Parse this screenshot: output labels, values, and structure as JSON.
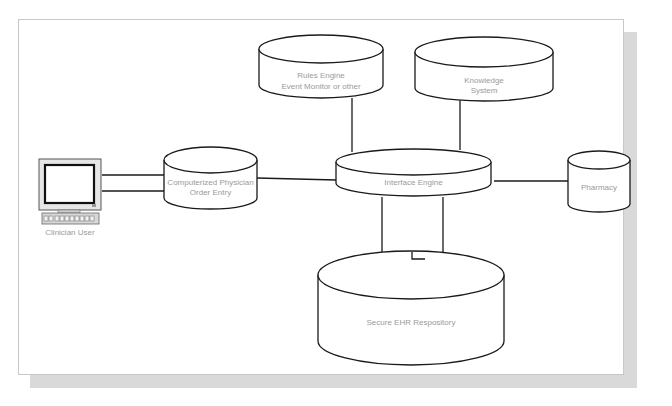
{
  "diagram": {
    "nodes": {
      "rules_engine": {
        "line1": "Rules Engine",
        "line2": "Event Monitor or other"
      },
      "knowledge_system": {
        "line1": "Knowledge",
        "line2": "System"
      },
      "cpoe": {
        "line1": "Computerized Physician",
        "line2": "Order Entry"
      },
      "interface_engine": {
        "label": "Interface Engine"
      },
      "pharmacy": {
        "label": "Pharmacy"
      },
      "ehr_repository": {
        "label": "Secure EHR Respository"
      },
      "clinician": {
        "label": "Clinician User",
        "icon": "computer-workstation-icon"
      }
    },
    "edges": [
      {
        "from": "clinician",
        "to": "cpoe",
        "style": "double-line"
      },
      {
        "from": "cpoe",
        "to": "interface_engine",
        "style": "line"
      },
      {
        "from": "rules_engine",
        "to": "interface_engine",
        "style": "line"
      },
      {
        "from": "knowledge_system",
        "to": "interface_engine",
        "style": "line"
      },
      {
        "from": "interface_engine",
        "to": "pharmacy",
        "style": "line"
      },
      {
        "from": "interface_engine",
        "to": "ehr_repository",
        "style": "double-line"
      }
    ],
    "colors": {
      "stroke": "#1a1a1a",
      "label": "#9a9a9a",
      "panel_border": "#c8c8c8",
      "shadow": "#d9d9d9"
    }
  }
}
